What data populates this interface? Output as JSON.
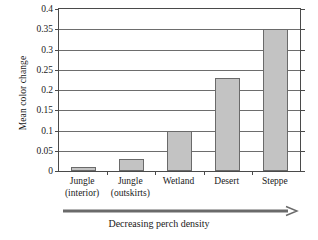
{
  "chart_data": {
    "type": "bar",
    "title": "",
    "xlabel": "Decreasing perch density",
    "ylabel": "Mean color change",
    "categories": [
      "Jungle (interior)",
      "Jungle (outskirts)",
      "Wetland",
      "Desert",
      "Steppe"
    ],
    "category_lines": [
      [
        "Jungle",
        "(interior)"
      ],
      [
        "Jungle",
        "(outskirts)"
      ],
      [
        "Wetland",
        ""
      ],
      [
        "Desert",
        ""
      ],
      [
        "Steppe",
        ""
      ]
    ],
    "values": [
      0.01,
      0.03,
      0.1,
      0.23,
      0.35
    ],
    "ylim": [
      0,
      0.4
    ],
    "ytick_values": [
      0,
      0.05,
      0.1,
      0.15,
      0.2,
      0.25,
      0.3,
      0.35,
      0.4
    ],
    "ytick_labels": [
      "0",
      "0.05",
      "0.1",
      "0.15",
      "0.2",
      "0.25",
      "0.3",
      "0.35",
      "0.4"
    ],
    "grid": true,
    "legend": false,
    "bar_color": "#c3c3c3",
    "bar_edge_color": "#6a6a6a",
    "axis_color": "#4a4a4a",
    "grid_color": "#6d6d6d"
  },
  "annotation": {
    "arrow_caption": "Decreasing perch density",
    "arrow_direction": "right"
  }
}
